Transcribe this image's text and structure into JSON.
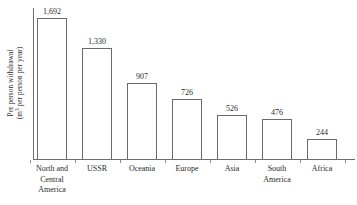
{
  "chart_data": {
    "type": "bar",
    "title": "",
    "xlabel": "",
    "ylabel": "Per person withdrawal (m3 per person per year)",
    "ylabel_line1": "Per person withdrawal",
    "ylabel_line2_pre": "(m",
    "ylabel_line2_sup": "3",
    "ylabel_line2_post": " per person per year)",
    "categories": [
      "North and Central America",
      "USSR",
      "Oceania",
      "Europe",
      "Asia",
      "South America",
      "Africa"
    ],
    "category_display": [
      "North and\nCentral\nAmerica",
      "USSR",
      "Oceania",
      "Europe",
      "Asia",
      "South\nAmerica",
      "Africa"
    ],
    "values": [
      1692,
      1330,
      907,
      726,
      526,
      476,
      244
    ],
    "value_labels": [
      "1,692",
      "1,330",
      "907",
      "726",
      "526",
      "476",
      "244"
    ],
    "ylim": [
      0,
      1692
    ],
    "grid": false,
    "legend": false,
    "bar_fill": "#ffffff",
    "bar_edge": "#6b6b6b",
    "axis_color": "#6e6e6e",
    "text_color": "#2b2b2b",
    "background": "#ffffff"
  }
}
